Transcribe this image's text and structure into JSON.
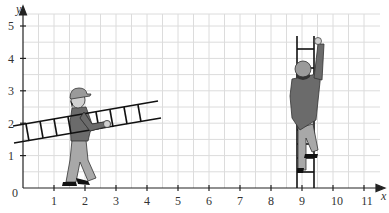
{
  "figure": {
    "x_axis": {
      "label": "x",
      "ticks": [
        "1",
        "2",
        "3",
        "4",
        "5",
        "6",
        "7",
        "8",
        "9",
        "10",
        "11"
      ],
      "origin_label": "0"
    },
    "y_axis": {
      "label": "y",
      "ticks": [
        "1",
        "2",
        "3",
        "4",
        "5"
      ]
    },
    "grid": {
      "minor_step": 0.5,
      "color": "#d9d9d9"
    },
    "colors": {
      "axis": "#222222",
      "ladder": "#111111",
      "shirt": "#6b6b6b",
      "pants": "#a8a8a8",
      "cap": "#9a9a9a",
      "skin": "#d0d0d0"
    },
    "objects": [
      {
        "name": "carried-ladder",
        "from": [
          -0.3,
          1.4
        ],
        "to": [
          4.4,
          2.35
        ],
        "tilt": "slanted"
      },
      {
        "name": "vertical-ladder",
        "x_range": [
          8.7,
          9.2
        ],
        "y_range": [
          0,
          5.2
        ]
      }
    ]
  }
}
